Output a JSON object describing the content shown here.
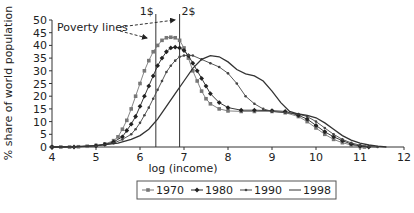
{
  "chart_data": {
    "type": "line",
    "title": "",
    "xlabel": "log (income)",
    "ylabel": "% share of world population",
    "xlim": [
      4,
      12
    ],
    "ylim": [
      0,
      50
    ],
    "x_ticks": [
      4,
      5,
      6,
      7,
      8,
      9,
      10,
      11,
      12
    ],
    "y_ticks": [
      0,
      5,
      10,
      15,
      20,
      25,
      30,
      35,
      40,
      45,
      50
    ],
    "grid": false,
    "legend_position": "bottom",
    "annotations": {
      "poverty_label": "Poverty lines",
      "lines": [
        {
          "label": "1$",
          "x": 6.36
        },
        {
          "label": "2$",
          "x": 6.9
        }
      ]
    },
    "series": [
      {
        "name": "1970",
        "marker": "square",
        "color": "#777777",
        "points": [
          [
            4,
            0
          ],
          [
            4.2,
            0
          ],
          [
            4.4,
            0
          ],
          [
            4.6,
            0.1
          ],
          [
            4.8,
            0.3
          ],
          [
            5,
            0.6
          ],
          [
            5.2,
            1.2
          ],
          [
            5.4,
            2.5
          ],
          [
            5.5,
            4
          ],
          [
            5.6,
            7
          ],
          [
            5.7,
            10.5
          ],
          [
            5.8,
            15
          ],
          [
            5.9,
            20
          ],
          [
            6,
            25
          ],
          [
            6.1,
            30
          ],
          [
            6.2,
            34
          ],
          [
            6.3,
            37.5
          ],
          [
            6.4,
            40
          ],
          [
            6.5,
            42
          ],
          [
            6.6,
            43
          ],
          [
            6.7,
            43.2
          ],
          [
            6.8,
            43
          ],
          [
            6.9,
            42
          ],
          [
            7,
            39
          ],
          [
            7.1,
            35
          ],
          [
            7.2,
            30
          ],
          [
            7.3,
            26
          ],
          [
            7.4,
            22
          ],
          [
            7.5,
            19
          ],
          [
            7.6,
            17
          ],
          [
            7.8,
            15
          ],
          [
            8,
            14.2
          ],
          [
            8.3,
            14
          ],
          [
            8.6,
            14
          ],
          [
            9,
            14
          ],
          [
            9.3,
            13.5
          ],
          [
            9.6,
            12
          ],
          [
            9.8,
            10
          ],
          [
            10,
            7.5
          ],
          [
            10.2,
            5
          ],
          [
            10.4,
            3
          ],
          [
            10.6,
            1.7
          ],
          [
            10.8,
            0.8
          ],
          [
            11,
            0.2
          ],
          [
            11.1,
            0
          ]
        ]
      },
      {
        "name": "1980",
        "marker": "diamond",
        "color": "#222222",
        "points": [
          [
            4,
            0
          ],
          [
            4.5,
            0
          ],
          [
            5,
            0.5
          ],
          [
            5.2,
            1
          ],
          [
            5.4,
            2
          ],
          [
            5.6,
            4
          ],
          [
            5.7,
            6.5
          ],
          [
            5.8,
            9
          ],
          [
            5.9,
            12
          ],
          [
            6,
            16
          ],
          [
            6.1,
            20
          ],
          [
            6.2,
            24
          ],
          [
            6.3,
            28
          ],
          [
            6.4,
            32
          ],
          [
            6.5,
            35
          ],
          [
            6.6,
            37.5
          ],
          [
            6.7,
            39
          ],
          [
            6.8,
            39.3
          ],
          [
            6.9,
            39
          ],
          [
            7,
            38
          ],
          [
            7.1,
            36
          ],
          [
            7.2,
            33
          ],
          [
            7.3,
            30
          ],
          [
            7.4,
            27
          ],
          [
            7.5,
            24
          ],
          [
            7.6,
            21
          ],
          [
            7.8,
            17.5
          ],
          [
            8,
            15.5
          ],
          [
            8.3,
            14.5
          ],
          [
            8.6,
            14.5
          ],
          [
            9,
            14.3
          ],
          [
            9.3,
            14
          ],
          [
            9.6,
            12.5
          ],
          [
            9.8,
            11
          ],
          [
            10,
            8.5
          ],
          [
            10.2,
            6
          ],
          [
            10.4,
            4
          ],
          [
            10.6,
            2.5
          ],
          [
            10.8,
            1.2
          ],
          [
            11,
            0.4
          ],
          [
            11.2,
            0
          ]
        ]
      },
      {
        "name": "1990",
        "marker": "dot",
        "color": "#444444",
        "points": [
          [
            4,
            0
          ],
          [
            4.5,
            0
          ],
          [
            5,
            0.4
          ],
          [
            5.4,
            1.5
          ],
          [
            5.6,
            3
          ],
          [
            5.8,
            5
          ],
          [
            5.9,
            7
          ],
          [
            6,
            9.5
          ],
          [
            6.1,
            12.5
          ],
          [
            6.2,
            15.5
          ],
          [
            6.3,
            19
          ],
          [
            6.4,
            22.5
          ],
          [
            6.5,
            26
          ],
          [
            6.6,
            29.5
          ],
          [
            6.7,
            32
          ],
          [
            6.8,
            34
          ],
          [
            6.9,
            35.5
          ],
          [
            7,
            36
          ],
          [
            7.1,
            36.2
          ],
          [
            7.2,
            36
          ],
          [
            7.4,
            34.5
          ],
          [
            7.6,
            33
          ],
          [
            7.8,
            31.5
          ],
          [
            8,
            29
          ],
          [
            8.2,
            25
          ],
          [
            8.4,
            20
          ],
          [
            8.6,
            17
          ],
          [
            8.8,
            15
          ],
          [
            9,
            14
          ],
          [
            9.3,
            13.5
          ],
          [
            9.6,
            13
          ],
          [
            9.8,
            12
          ],
          [
            10,
            10
          ],
          [
            10.2,
            7.5
          ],
          [
            10.4,
            5
          ],
          [
            10.6,
            3
          ],
          [
            10.8,
            1.6
          ],
          [
            11,
            0.7
          ],
          [
            11.2,
            0.2
          ],
          [
            11.4,
            0
          ]
        ]
      },
      {
        "name": "1998",
        "marker": "none",
        "color": "#333333",
        "points": [
          [
            4,
            0
          ],
          [
            4.5,
            0.1
          ],
          [
            5,
            0.5
          ],
          [
            5.5,
            1.5
          ],
          [
            5.8,
            3
          ],
          [
            6,
            4.5
          ],
          [
            6.2,
            7
          ],
          [
            6.4,
            11
          ],
          [
            6.6,
            16
          ],
          [
            6.8,
            21
          ],
          [
            7,
            26
          ],
          [
            7.2,
            31
          ],
          [
            7.4,
            34.5
          ],
          [
            7.6,
            36
          ],
          [
            7.8,
            35.5
          ],
          [
            8,
            33.5
          ],
          [
            8.2,
            30.5
          ],
          [
            8.4,
            28.8
          ],
          [
            8.6,
            28
          ],
          [
            8.8,
            26
          ],
          [
            9,
            22
          ],
          [
            9.2,
            17.5
          ],
          [
            9.4,
            14
          ],
          [
            9.6,
            13
          ],
          [
            9.8,
            12.5
          ],
          [
            10,
            11.5
          ],
          [
            10.2,
            9.5
          ],
          [
            10.4,
            7
          ],
          [
            10.6,
            4.5
          ],
          [
            10.8,
            2.7
          ],
          [
            11,
            1.5
          ],
          [
            11.2,
            0.8
          ],
          [
            11.4,
            0.3
          ],
          [
            11.6,
            0
          ]
        ]
      }
    ]
  },
  "legend": {
    "items": [
      "1970",
      "1980",
      "1990",
      "1998"
    ]
  }
}
